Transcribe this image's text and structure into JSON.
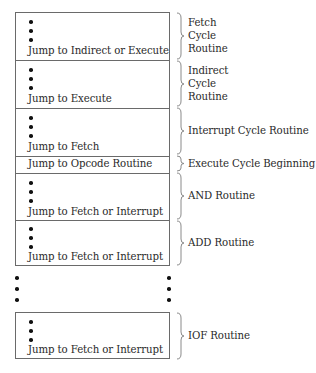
{
  "diagram": {
    "type": "microprogram-memory-layout",
    "main_block": {
      "sections": [
        {
          "id": "fetch",
          "instruction": "Jump to Indirect or Execute",
          "has_ellipsis": true,
          "label_lines": [
            "Fetch",
            "Cycle",
            "Routine"
          ]
        },
        {
          "id": "indirect",
          "instruction": "Jump to Execute",
          "has_ellipsis": true,
          "label_lines": [
            "Indirect",
            "Cycle",
            "Routine"
          ]
        },
        {
          "id": "interrupt",
          "instruction": "Jump to Fetch",
          "has_ellipsis": true,
          "label_lines": [
            "Interrupt Cycle Routine"
          ]
        },
        {
          "id": "execute-begin",
          "instruction": "Jump to Opcode Routine",
          "has_ellipsis": false,
          "label_lines": [
            "Execute Cycle Beginning"
          ]
        },
        {
          "id": "and",
          "instruction": "Jump to Fetch or Interrupt",
          "has_ellipsis": true,
          "label_lines": [
            "AND Routine"
          ]
        },
        {
          "id": "add",
          "instruction": "Jump to Fetch or Interrupt",
          "has_ellipsis": true,
          "label_lines": [
            "ADD Routine"
          ]
        }
      ]
    },
    "continuation": "vertical-ellipsis",
    "last_block": {
      "id": "iof",
      "instruction": "Jump to Fetch or Interrupt",
      "has_ellipsis": true,
      "label_lines": [
        "IOF Routine"
      ]
    },
    "colors": {
      "border": "#6a6a6a",
      "text": "#2a2a2a",
      "dot": "#111111",
      "brace": "#8a8a8a"
    }
  }
}
